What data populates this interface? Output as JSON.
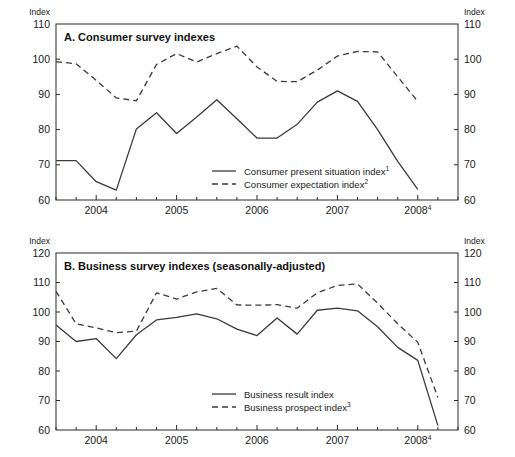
{
  "figure": {
    "axis_unit_label": "Index",
    "x_tick_labels": [
      "2004",
      "2005",
      "2006",
      "2007",
      "2008"
    ],
    "x_last_tick_superscript": "4"
  },
  "chart_data": [
    {
      "id": "panel-a",
      "type": "line",
      "title": "A. Consumer survey indexes",
      "xlabel": "",
      "ylabel": "Index",
      "ylim": [
        60,
        110
      ],
      "y_ticks": [
        60,
        70,
        80,
        90,
        100,
        110
      ],
      "x_tick_labels": [
        "2004",
        "2005",
        "2006",
        "2007",
        "2008"
      ],
      "x_tick_values": [
        2004.0,
        2005.0,
        2006.0,
        2007.0,
        2008.0
      ],
      "xlim": [
        2003.5,
        2008.5
      ],
      "grid": false,
      "legend_position": "inside-center-lower",
      "x": [
        2003.5,
        2003.75,
        2004.0,
        2004.25,
        2004.5,
        2004.75,
        2005.0,
        2005.25,
        2005.5,
        2005.75,
        2006.0,
        2006.25,
        2006.5,
        2006.75,
        2007.0,
        2007.25,
        2007.5,
        2007.75,
        2008.0,
        2008.25
      ],
      "series": [
        {
          "name": "Consumer present situation index",
          "superscript": "1",
          "style": "solid",
          "values": [
            71.2,
            71.2,
            65.2,
            62.8,
            80.2,
            84.8,
            78.9,
            83.6,
            88.5,
            83.1,
            77.6,
            77.6,
            81.5,
            87.8,
            91.0,
            88.0,
            80.0,
            71.0,
            63.0,
            null
          ]
        },
        {
          "name": "Consumer expectation index",
          "superscript": "2",
          "style": "dashed",
          "values": [
            99.3,
            98.7,
            94.0,
            89.0,
            88.2,
            98.5,
            101.6,
            99.2,
            101.6,
            103.7,
            97.8,
            93.7,
            93.6,
            96.9,
            100.9,
            102.2,
            102.1,
            95.0,
            88.0,
            null
          ]
        }
      ]
    },
    {
      "id": "panel-b",
      "type": "line",
      "title": "B. Business survey indexes (seasonally-adjusted)",
      "xlabel": "",
      "ylabel": "Index",
      "ylim": [
        60,
        120
      ],
      "y_ticks": [
        60,
        70,
        80,
        90,
        100,
        110,
        120
      ],
      "x_tick_labels": [
        "2004",
        "2005",
        "2006",
        "2007",
        "2008"
      ],
      "x_tick_values": [
        2004.0,
        2005.0,
        2006.0,
        2007.0,
        2008.0
      ],
      "xlim": [
        2003.5,
        2008.5
      ],
      "grid": false,
      "legend_position": "inside-center-lower",
      "x": [
        2003.5,
        2003.75,
        2004.0,
        2004.25,
        2004.5,
        2004.75,
        2005.0,
        2005.25,
        2005.5,
        2005.75,
        2006.0,
        2006.25,
        2006.5,
        2006.75,
        2007.0,
        2007.25,
        2007.5,
        2007.75,
        2008.0,
        2008.25
      ],
      "series": [
        {
          "name": "Business result index",
          "superscript": "",
          "style": "solid",
          "values": [
            95.6,
            90.0,
            91.0,
            84.2,
            92.3,
            97.3,
            98.2,
            99.4,
            97.7,
            94.2,
            92.0,
            98.0,
            92.5,
            100.6,
            101.3,
            100.4,
            95.0,
            88.0,
            83.6,
            61.5
          ]
        },
        {
          "name": "Business prospect index",
          "superscript": "3",
          "style": "dashed",
          "values": [
            107.0,
            96.0,
            94.6,
            93.0,
            93.5,
            106.5,
            104.4,
            106.8,
            108.0,
            102.4,
            102.3,
            102.5,
            101.3,
            106.5,
            109.0,
            109.5,
            103.0,
            96.0,
            89.7,
            71.0
          ]
        }
      ]
    }
  ]
}
